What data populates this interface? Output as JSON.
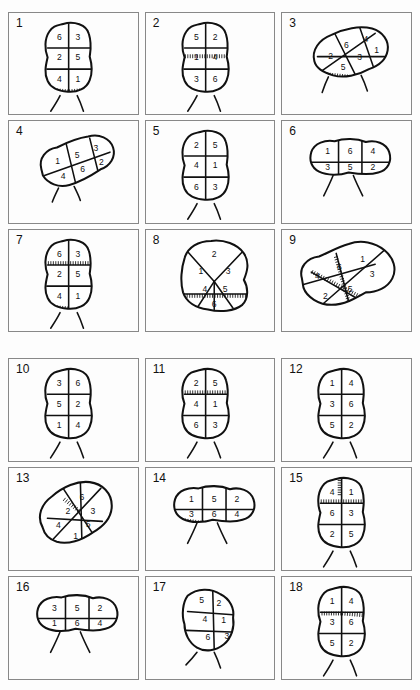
{
  "figure": {
    "title": "",
    "panel_count": 18,
    "region_count_per_panel": 6,
    "groups": [
      {
        "name": "group-a",
        "panel_ids": [
          "1",
          "2",
          "3",
          "4",
          "5",
          "6",
          "7",
          "8",
          "9"
        ]
      },
      {
        "name": "group-b",
        "panel_ids": [
          "10",
          "11",
          "12",
          "13",
          "14",
          "15",
          "16",
          "17",
          "18"
        ]
      }
    ],
    "colors": {
      "ink": "#111111",
      "panel_border": "#888888",
      "paper": "#fdfdfd",
      "fill": "#ffffff"
    }
  },
  "panels": [
    {
      "id": "1",
      "label": "1",
      "layout": "vertical-2x3",
      "rows": [
        [
          "6",
          "3"
        ],
        [
          "2",
          "5"
        ],
        [
          "4",
          "1"
        ]
      ],
      "numbers": [
        "6",
        "3",
        "2",
        "5",
        "4",
        "1"
      ],
      "hatched_edges": [
        "bottom-left",
        "bottom-right"
      ],
      "whiskers": 2
    },
    {
      "id": "2",
      "label": "2",
      "layout": "vertical-2x3",
      "rows": [
        [
          "5",
          "2"
        ],
        [
          "1",
          "4"
        ],
        [
          "3",
          "6"
        ]
      ],
      "numbers": [
        "5",
        "2",
        "1",
        "4",
        "3",
        "6"
      ],
      "hatched_edges": [
        "mid-band"
      ],
      "whiskers": 2
    },
    {
      "id": "3",
      "label": "3",
      "layout": "tilted-radial",
      "rows": [
        [
          "2",
          "6",
          "4"
        ],
        [
          "5",
          "3",
          "1"
        ]
      ],
      "numbers": [
        "2",
        "6",
        "4",
        "1",
        "3",
        "5"
      ],
      "hatched_edges": [
        "bottom"
      ],
      "whiskers": 2
    },
    {
      "id": "4",
      "label": "4",
      "layout": "diagonal-2x3",
      "rows": [
        [
          "1",
          "5",
          "3"
        ],
        [
          "4",
          "6",
          "2"
        ]
      ],
      "numbers": [
        "1",
        "5",
        "3",
        "4",
        "6",
        "2"
      ],
      "hatched_edges": [],
      "whiskers": 2
    },
    {
      "id": "5",
      "label": "5",
      "layout": "vertical-2x3",
      "rows": [
        [
          "2",
          "5"
        ],
        [
          "4",
          "1"
        ],
        [
          "6",
          "3"
        ]
      ],
      "numbers": [
        "2",
        "5",
        "4",
        "1",
        "6",
        "3"
      ],
      "hatched_edges": [],
      "whiskers": 2
    },
    {
      "id": "6",
      "label": "6",
      "layout": "horizontal-3x2",
      "rows": [
        [
          "1",
          "6",
          "4"
        ],
        [
          "3",
          "5",
          "2"
        ]
      ],
      "numbers": [
        "1",
        "6",
        "4",
        "3",
        "5",
        "2"
      ],
      "hatched_edges": [],
      "whiskers": 2
    },
    {
      "id": "7",
      "label": "7",
      "layout": "vertical-2x3",
      "rows": [
        [
          "6",
          "3"
        ],
        [
          "2",
          "5"
        ],
        [
          "4",
          "1"
        ]
      ],
      "numbers": [
        "6",
        "3",
        "2",
        "5",
        "4",
        "1"
      ],
      "hatched_edges": [
        "upper-band",
        "bottom-left"
      ],
      "whiskers": 2
    },
    {
      "id": "8",
      "label": "8",
      "layout": "radial-fan",
      "rows": [
        [
          "2"
        ],
        [
          "1",
          "3"
        ],
        [
          "4",
          "5"
        ],
        [
          "6"
        ]
      ],
      "numbers": [
        "2",
        "1",
        "3",
        "4",
        "5",
        "6"
      ],
      "hatched_edges": [
        "lower-band"
      ],
      "whiskers": 0
    },
    {
      "id": "9",
      "label": "9",
      "layout": "diagonal-irregular",
      "rows": [
        [
          "1",
          "3"
        ],
        [
          "6",
          "4",
          "5",
          "2"
        ]
      ],
      "numbers": [
        "1",
        "6",
        "4",
        "3",
        "5",
        "2"
      ],
      "hatched_edges": [
        "inner-seam"
      ],
      "whiskers": 0
    },
    {
      "id": "10",
      "label": "10",
      "layout": "vertical-2x3",
      "rows": [
        [
          "3",
          "6"
        ],
        [
          "5",
          "2"
        ],
        [
          "1",
          "4"
        ]
      ],
      "numbers": [
        "3",
        "6",
        "5",
        "2",
        "1",
        "4"
      ],
      "hatched_edges": [],
      "whiskers": 2
    },
    {
      "id": "11",
      "label": "11",
      "layout": "vertical-2x3",
      "rows": [
        [
          "2",
          "5"
        ],
        [
          "4",
          "1"
        ],
        [
          "6",
          "3"
        ]
      ],
      "numbers": [
        "2",
        "5",
        "4",
        "1",
        "6",
        "3"
      ],
      "hatched_edges": [
        "upper-band"
      ],
      "whiskers": 2
    },
    {
      "id": "12",
      "label": "12",
      "layout": "vertical-2x3",
      "rows": [
        [
          "1",
          "4"
        ],
        [
          "3",
          "6"
        ],
        [
          "5",
          "2"
        ]
      ],
      "numbers": [
        "1",
        "4",
        "3",
        "6",
        "5",
        "2"
      ],
      "hatched_edges": [],
      "whiskers": 2
    },
    {
      "id": "13",
      "label": "13",
      "layout": "diagonal-diamond",
      "rows": [
        [
          "6",
          "3"
        ],
        [
          "2",
          "5"
        ],
        [
          "4",
          "1"
        ]
      ],
      "numbers": [
        "6",
        "3",
        "2",
        "5",
        "4",
        "1"
      ],
      "hatched_edges": [
        "upper-left"
      ],
      "whiskers": 0
    },
    {
      "id": "14",
      "label": "14",
      "layout": "horizontal-3x2",
      "rows": [
        [
          "1",
          "5",
          "2"
        ],
        [
          "3",
          "6",
          "4"
        ]
      ],
      "numbers": [
        "1",
        "5",
        "2",
        "3",
        "6",
        "4"
      ],
      "hatched_edges": [
        "bottom-left",
        "bottom-mid"
      ],
      "whiskers": 2
    },
    {
      "id": "15",
      "label": "15",
      "layout": "vertical-2x3",
      "rows": [
        [
          "4",
          "1"
        ],
        [
          "6",
          "3"
        ],
        [
          "2",
          "5"
        ]
      ],
      "numbers": [
        "4",
        "1",
        "6",
        "3",
        "2",
        "5"
      ],
      "hatched_edges": [
        "top-mid",
        "upper-band"
      ],
      "whiskers": 2
    },
    {
      "id": "16",
      "label": "16",
      "layout": "horizontal-3x2",
      "rows": [
        [
          "3",
          "5",
          "2"
        ],
        [
          "1",
          "6",
          "4"
        ]
      ],
      "numbers": [
        "3",
        "5",
        "2",
        "1",
        "6",
        "4"
      ],
      "hatched_edges": [],
      "whiskers": 2
    },
    {
      "id": "17",
      "label": "17",
      "layout": "tilted-2x3",
      "rows": [
        [
          "5",
          "2"
        ],
        [
          "4",
          "1"
        ],
        [
          "6",
          "3"
        ]
      ],
      "numbers": [
        "5",
        "2",
        "4",
        "1",
        "6",
        "3"
      ],
      "hatched_edges": [],
      "whiskers": 2
    },
    {
      "id": "18",
      "label": "18",
      "layout": "vertical-2x3",
      "rows": [
        [
          "1",
          "4"
        ],
        [
          "3",
          "6"
        ],
        [
          "5",
          "2"
        ]
      ],
      "numbers": [
        "1",
        "4",
        "3",
        "6",
        "5",
        "2"
      ],
      "hatched_edges": [
        "mid-band-left",
        "mid-band-right"
      ],
      "whiskers": 2
    }
  ]
}
